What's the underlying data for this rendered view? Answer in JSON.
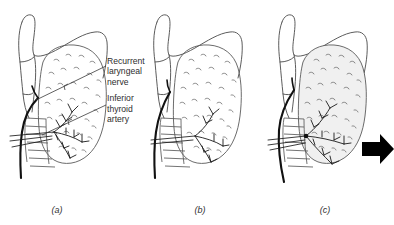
{
  "figure": {
    "name": "thyroid-larynx-three-panel-figure",
    "background_color": "#ffffff",
    "line_color": "#4a4a4a",
    "nerve_color": "#111111",
    "artery_color": "#1a1a1a",
    "arrow_color": "#000000",
    "text_color": "#2d2d2d"
  },
  "labels": {
    "recurrent_nerve": "Recurrent\nlaryngeal\nnerve",
    "recurrent_nerve_line1": "Recurrent",
    "recurrent_nerve_line2": "laryngeal",
    "recurrent_nerve_line3": "nerve",
    "inferior_artery_line1": "Inferior",
    "inferior_artery_line2": "thyroid",
    "inferior_artery_line3": "artery"
  },
  "captions": {
    "a": "(a)",
    "b": "(b)",
    "c": "(c)"
  },
  "panels": [
    {
      "id": "a",
      "caption": "(a)",
      "has_labels": true,
      "has_arrow": false,
      "gland_shaded": false
    },
    {
      "id": "b",
      "caption": "(b)",
      "has_labels": false,
      "has_arrow": false,
      "gland_shaded": false
    },
    {
      "id": "c",
      "caption": "(c)",
      "has_labels": false,
      "has_arrow": true,
      "gland_shaded": true
    }
  ],
  "structures": [
    "larynx-cartilage",
    "thyroid-gland-lobe",
    "trachea-rings",
    "recurrent-laryngeal-nerve",
    "inferior-thyroid-artery",
    "arterial-branches"
  ],
  "arrow": {
    "direction": "right",
    "color": "#000000"
  }
}
